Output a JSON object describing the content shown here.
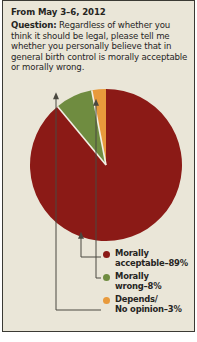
{
  "header": {
    "date_line": "From May 3–6, 2012",
    "question_label": "Question:",
    "question_text": " Regardless of whether you think it should be legal, please tell me whether you personally believe that in general birth control is morally acceptable or morally wrong."
  },
  "colors": {
    "background": "#EAE6D8",
    "border": "#3b3a34",
    "text": "#26251f",
    "morally_acceptable": "#8B1A16",
    "morally_wrong": "#6F8C40",
    "depends_no_opinion": "#E89A3C",
    "separator": "#EAE6D8",
    "leader_line": "#4a4840"
  },
  "legend": {
    "items": [
      {
        "name": "morally-acceptable",
        "line1": "Morally",
        "line2": "acceptable–89%",
        "color": "#8B1A16"
      },
      {
        "name": "morally-wrong",
        "line1": "Morally",
        "line2": "wrong–8%",
        "color": "#6F8C40"
      },
      {
        "name": "depends-no-opinion",
        "line1": "Depends/",
        "line2": "No opinion–3%",
        "color": "#E89A3C"
      }
    ]
  },
  "chart_data": {
    "type": "pie",
    "title": "",
    "categories": [
      "Morally acceptable",
      "Morally wrong",
      "Depends/No opinion"
    ],
    "values": [
      89,
      8,
      3
    ],
    "unit": "%",
    "labels": [
      "Morally acceptable–89%",
      "Morally wrong–8%",
      "Depends/No opinion–3%"
    ],
    "colors": [
      "#8B1A16",
      "#6F8C40",
      "#E89A3C"
    ],
    "legend_position": "bottom-right",
    "start_angle_deg": -90,
    "direction": "clockwise",
    "grid": false
  }
}
